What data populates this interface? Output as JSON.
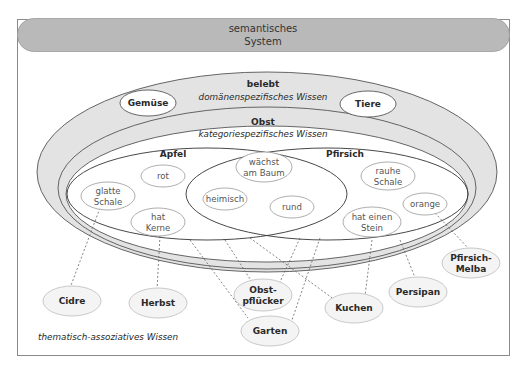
{
  "header": {
    "line1": "semantisches",
    "line2": "System"
  },
  "regions": {
    "belebt": {
      "title": "belebt",
      "subtitle": "domänenspezifisches Wissen"
    },
    "obst": {
      "title": "Obst",
      "subtitle": "kategoriespezifisches Wissen"
    },
    "apfel": {
      "title": "Apfel"
    },
    "pfirsich": {
      "title": "Pfirsich"
    },
    "thematic": {
      "subtitle": "thematisch-assoziatives Wissen"
    }
  },
  "domain_nodes": {
    "gemuese": "Gemüse",
    "tiere": "Tiere"
  },
  "apfel_features": {
    "glatte_1": "glatte",
    "glatte_2": "Schale",
    "rot": "rot",
    "kerne_1": "hat",
    "kerne_2": "Kerne"
  },
  "shared_features": {
    "baum_1": "wächst",
    "baum_2": "am Baum",
    "heimisch": "heimisch",
    "rund": "rund"
  },
  "pfirsich_features": {
    "rauhe_1": "rauhe",
    "rauhe_2": "Schale",
    "orange": "orange",
    "stein_1": "hat einen",
    "stein_2": "Stein"
  },
  "associations": {
    "cidre": "Cidre",
    "herbst": "Herbst",
    "obstpfluecker_1": "Obst-",
    "obstpfluecker_2": "pflücker",
    "garten": "Garten",
    "kuchen": "Kuchen",
    "persipan": "Persipan",
    "melba_1": "Pfirsich-",
    "melba_2": "Melba"
  },
  "colors": {
    "header_fill": "#b9b9b9",
    "ring_fill": "#e3e3e3",
    "assoc_fill": "#f4f4f4",
    "stroke": "#555555"
  }
}
